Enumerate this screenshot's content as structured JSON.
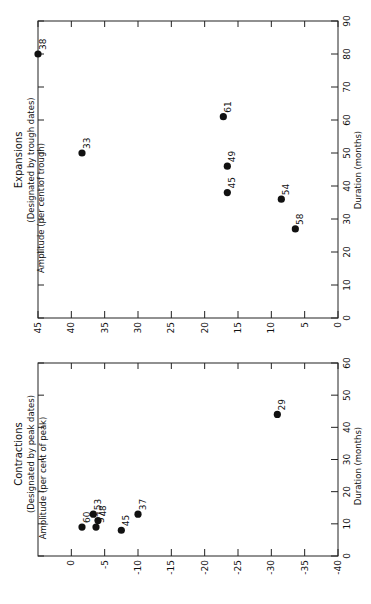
{
  "chart_data": [
    {
      "type": "scatter",
      "panel": "top",
      "title": "Expansions",
      "subtitle": "(Designated by trough dates)",
      "xlabel": "Duration (months)",
      "ylabel": "Amplitude (per cent of trough)",
      "xlim": [
        0,
        90
      ],
      "ylim": [
        0,
        45
      ],
      "x_ticks": [
        0,
        10,
        20,
        30,
        40,
        50,
        60,
        70,
        80,
        90
      ],
      "y_ticks": [
        0,
        5,
        10,
        15,
        20,
        25,
        30,
        35,
        40,
        45
      ],
      "grid": false,
      "orientation": "rotated 90deg counterclockwise",
      "points": [
        {
          "label": "38",
          "duration": 80,
          "amplitude": 45
        },
        {
          "label": "33",
          "duration": 50,
          "amplitude": 38.4
        },
        {
          "label": "61",
          "duration": 61,
          "amplitude": 17.2
        },
        {
          "label": "49",
          "duration": 46,
          "amplitude": 16.6
        },
        {
          "label": "45",
          "duration": 38,
          "amplitude": 16.6
        },
        {
          "label": "54",
          "duration": 36,
          "amplitude": 8.5
        },
        {
          "label": "58",
          "duration": 27,
          "amplitude": 6.4
        }
      ]
    },
    {
      "type": "scatter",
      "panel": "bottom",
      "title": "Contractions",
      "subtitle": "(Designated by peak dates)",
      "xlabel": "Duration (months)",
      "ylabel": "Amplitude (per cent of peak)",
      "xlim": [
        0,
        60
      ],
      "ylim": [
        -40,
        5
      ],
      "x_ticks": [
        0,
        10,
        20,
        30,
        40,
        50,
        60
      ],
      "y_ticks": [
        0,
        -5,
        -10,
        -15,
        -20,
        -25,
        -30,
        -35,
        -40
      ],
      "grid": false,
      "orientation": "rotated 90deg counterclockwise",
      "points": [
        {
          "label": "60",
          "duration": 9,
          "amplitude": -1.6
        },
        {
          "label": "53",
          "duration": 13,
          "amplitude": -3.3
        },
        {
          "label": "48",
          "duration": 11,
          "amplitude": -4.0
        },
        {
          "label": "57",
          "duration": 9,
          "amplitude": -3.7
        },
        {
          "label": "45",
          "duration": 8,
          "amplitude": -7.5
        },
        {
          "label": "37",
          "duration": 13,
          "amplitude": -10.0
        },
        {
          "label": "29",
          "duration": 44,
          "amplitude": -30.9
        }
      ]
    }
  ],
  "labels": {
    "exp_title": "Expansions",
    "exp_subtitle": "(Designated by trough dates)",
    "exp_ylabel": "Amplitude (per cent of trough)",
    "exp_xlabel": "Duration (months)",
    "con_title": "Contractions",
    "con_subtitle": "(Designated by peak dates)",
    "con_ylabel": "Amplitude (per cent of peak)",
    "con_xlabel": "Duration (months)"
  }
}
